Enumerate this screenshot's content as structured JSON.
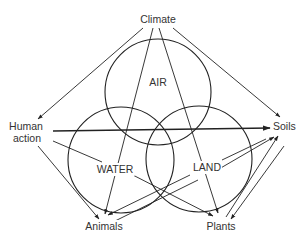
{
  "diagram": {
    "title": "",
    "nodes": {
      "climate": "Climate",
      "human_action_line1": "Human",
      "human_action_line2": "action",
      "soils": "Soils",
      "animals": "Animals",
      "plants": "Plants"
    },
    "regions": {
      "air": "AIR",
      "water": "WATER",
      "land": "LAND"
    },
    "circles": [
      {
        "name": "AIR",
        "cx": 158,
        "cy": 92,
        "r": 53
      },
      {
        "name": "WATER",
        "cx": 121,
        "cy": 160,
        "r": 53
      },
      {
        "name": "LAND",
        "cx": 199,
        "cy": 159,
        "r": 53
      }
    ],
    "edges": [
      {
        "from": "Climate",
        "to": "Human action"
      },
      {
        "from": "Climate",
        "to": "Soils"
      },
      {
        "from": "Climate",
        "to": "Animals"
      },
      {
        "from": "Climate",
        "to": "Plants"
      },
      {
        "from": "Human action",
        "to": "Soils"
      },
      {
        "from": "Human action",
        "to": "Animals"
      },
      {
        "from": "Human action",
        "to": "Plants"
      },
      {
        "from": "Soils",
        "to": "Animals"
      },
      {
        "from": "Animals",
        "to": "Soils"
      },
      {
        "from": "Plants",
        "to": "Soils"
      },
      {
        "from": "Soils",
        "to": "Plants"
      }
    ],
    "colors": {
      "line": "#222222",
      "text": "#333333",
      "background": "#ffffff"
    }
  }
}
